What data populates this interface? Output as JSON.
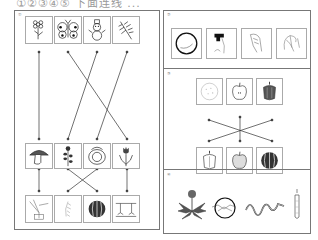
{
  "header": {
    "text": "①②③④⑤ 下面连线 ..."
  },
  "left_panel": {
    "label": "①",
    "row1": [
      "flower",
      "butterfly",
      "snowman",
      "pine-branch"
    ],
    "row2": [
      "mushroom",
      "sunflower-stem",
      "cabbage",
      "tulip"
    ],
    "row3": [
      "wheat-ears",
      "grain-stalk",
      "watermelon",
      "sprouts"
    ],
    "connections_row1_row2": [
      [
        0,
        0
      ],
      [
        1,
        3
      ],
      [
        2,
        1
      ],
      [
        3,
        1
      ]
    ],
    "connections_row2_row3": [
      [
        0,
        0
      ],
      [
        1,
        2
      ],
      [
        2,
        1
      ],
      [
        3,
        3
      ]
    ]
  },
  "right_panels": [
    {
      "label": "②",
      "items": [
        "circle-plate",
        "faucet-hand",
        "hand-drawn",
        "hand-sketch"
      ]
    },
    {
      "label": "③",
      "top": [
        "melon-slice",
        "apple",
        "bell-pepper"
      ],
      "bottom": [
        "bell-pepper",
        "apple",
        "watermelon"
      ]
    },
    {
      "label": "④",
      "items": [
        "dandelion",
        "circled-insect",
        "snake",
        "carrot"
      ]
    }
  ],
  "colors": {
    "border": "#777777",
    "card_border": "#aaaaaa",
    "line": "#333333"
  }
}
